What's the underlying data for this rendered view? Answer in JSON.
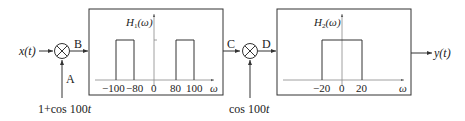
{
  "diagram": {
    "input_signal": "x(t)",
    "output_signal": "y(t)",
    "nodes": {
      "A": "A",
      "B": "B",
      "C": "C",
      "D": "D"
    },
    "multiplier1": {
      "carrier": "1+cos 100t"
    },
    "multiplier2": {
      "carrier": "cos 100t"
    },
    "filter1": {
      "title": "H",
      "sub": "1",
      "arg": "(ω)",
      "axis_label": "ω",
      "ticks": [
        "−100",
        "−80",
        "0",
        "80",
        "100"
      ],
      "passbands": [
        [
          -100,
          -80
        ],
        [
          80,
          100
        ]
      ]
    },
    "filter2": {
      "title": "H",
      "sub": "2",
      "arg": "(ω)",
      "axis_label": "ω",
      "ticks": [
        "−20",
        "0",
        "20"
      ],
      "passbands": [
        [
          -20,
          20
        ]
      ]
    }
  }
}
